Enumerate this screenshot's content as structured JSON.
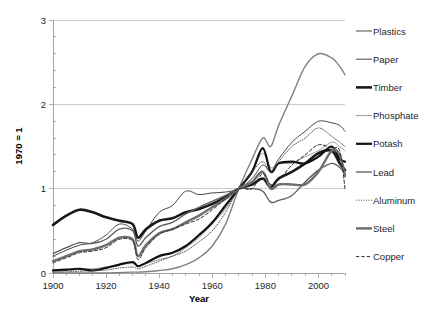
{
  "chart_data": {
    "type": "line",
    "title": "",
    "xlabel": "Year",
    "ylabel": "1970 = 1",
    "xlim": [
      1900,
      2010
    ],
    "ylim": [
      0,
      3
    ],
    "xticks": [
      1900,
      1920,
      1940,
      1960,
      1980,
      2000
    ],
    "xtick_labels": [
      "1900",
      "1920",
      "1940",
      "1960",
      "1980",
      "2000"
    ],
    "yticks": [
      0,
      1,
      2,
      3
    ],
    "ytick_labels": [
      "0",
      "1",
      "2",
      "3"
    ],
    "x_minor_tick_step": 5,
    "y_minor_tick_step": 0.2,
    "grid": "horizontal",
    "legend_position": "right",
    "x": [
      1900,
      1905,
      1910,
      1915,
      1920,
      1925,
      1930,
      1932,
      1935,
      1940,
      1945,
      1950,
      1955,
      1960,
      1965,
      1970,
      1975,
      1979,
      1982,
      1985,
      1990,
      1995,
      2000,
      2005,
      2008,
      2010
    ],
    "series": [
      {
        "name": "Plastics",
        "style": "solid",
        "width": 1.4,
        "color": "#808080",
        "values": [
          0.0,
          0.0,
          0.0,
          0.0,
          0.0,
          0.005,
          0.01,
          0.01,
          0.015,
          0.03,
          0.05,
          0.1,
          0.18,
          0.32,
          0.58,
          1.0,
          1.35,
          1.6,
          1.5,
          1.75,
          2.1,
          2.45,
          2.6,
          2.55,
          2.45,
          2.35
        ]
      },
      {
        "name": "Paper",
        "style": "solid",
        "width": 0.9,
        "color": "#333333",
        "values": [
          0.2,
          0.27,
          0.33,
          0.36,
          0.45,
          0.58,
          0.52,
          0.38,
          0.5,
          0.72,
          0.8,
          0.97,
          0.93,
          0.95,
          0.96,
          1.0,
          1.12,
          1.28,
          1.2,
          1.35,
          1.55,
          1.68,
          1.8,
          1.78,
          1.75,
          1.68
        ]
      },
      {
        "name": "Timber",
        "style": "solid",
        "width": 2.6,
        "color": "#1a1a1a",
        "values": [
          0.57,
          0.68,
          0.75,
          0.72,
          0.66,
          0.62,
          0.58,
          0.42,
          0.52,
          0.62,
          0.65,
          0.72,
          0.76,
          0.82,
          0.9,
          1.0,
          1.05,
          1.12,
          1.02,
          1.12,
          1.2,
          1.3,
          1.42,
          1.45,
          1.3,
          1.22
        ]
      },
      {
        "name": "Phosphate",
        "style": "solid",
        "width": 0.9,
        "color": "#8c8c8c",
        "values": [
          0.02,
          0.03,
          0.04,
          0.05,
          0.07,
          0.1,
          0.11,
          0.08,
          0.11,
          0.16,
          0.2,
          0.3,
          0.42,
          0.58,
          0.76,
          1.0,
          1.22,
          1.42,
          1.25,
          1.3,
          1.3,
          1.38,
          1.45,
          1.55,
          1.5,
          1.45
        ]
      },
      {
        "name": "Potash",
        "style": "solid",
        "width": 2.2,
        "color": "#111111",
        "values": [
          0.03,
          0.04,
          0.05,
          0.03,
          0.06,
          0.1,
          0.13,
          0.08,
          0.12,
          0.2,
          0.24,
          0.32,
          0.45,
          0.6,
          0.8,
          1.0,
          1.2,
          1.48,
          1.2,
          1.3,
          1.32,
          1.3,
          1.38,
          1.5,
          1.35,
          1.32
        ]
      },
      {
        "name": "Lead",
        "style": "solid",
        "width": 1.3,
        "color": "#5a5a5a",
        "values": [
          0.23,
          0.3,
          0.36,
          0.35,
          0.4,
          0.52,
          0.5,
          0.32,
          0.42,
          0.55,
          0.6,
          0.7,
          0.78,
          0.85,
          0.92,
          1.0,
          1.0,
          0.97,
          0.84,
          0.86,
          0.92,
          1.08,
          1.22,
          1.3,
          1.25,
          1.18
        ]
      },
      {
        "name": "Aluminum",
        "style": "dotted",
        "width": 1.0,
        "color": "#4d4d4d",
        "values": [
          0.01,
          0.015,
          0.02,
          0.025,
          0.035,
          0.06,
          0.07,
          0.05,
          0.08,
          0.14,
          0.2,
          0.26,
          0.37,
          0.5,
          0.72,
          1.0,
          1.2,
          1.32,
          1.2,
          1.32,
          1.5,
          1.6,
          1.72,
          1.62,
          1.55,
          1.5
        ]
      },
      {
        "name": "Steel",
        "style": "solid",
        "width": 2.4,
        "color": "#6e6e6e",
        "values": [
          0.14,
          0.2,
          0.26,
          0.28,
          0.33,
          0.42,
          0.4,
          0.2,
          0.33,
          0.47,
          0.52,
          0.6,
          0.68,
          0.78,
          0.88,
          1.0,
          1.08,
          1.2,
          1.0,
          1.05,
          1.05,
          1.05,
          1.2,
          1.45,
          1.4,
          1.15
        ]
      },
      {
        "name": "Copper",
        "style": "dashed",
        "width": 1.0,
        "color": "#2b2b2b",
        "values": [
          0.12,
          0.18,
          0.24,
          0.26,
          0.3,
          0.4,
          0.38,
          0.16,
          0.3,
          0.46,
          0.52,
          0.58,
          0.64,
          0.75,
          0.88,
          1.0,
          1.0,
          1.18,
          1.05,
          1.1,
          1.28,
          1.4,
          1.52,
          1.48,
          1.45,
          1.0
        ]
      }
    ]
  },
  "legend": {
    "items": [
      {
        "label": "Plastics"
      },
      {
        "label": "Paper"
      },
      {
        "label": "Timber"
      },
      {
        "label": "Phosphate"
      },
      {
        "label": "Potash"
      },
      {
        "label": "Lead"
      },
      {
        "label": "Aluminum"
      },
      {
        "label": "Steel"
      },
      {
        "label": "Copper"
      }
    ]
  }
}
